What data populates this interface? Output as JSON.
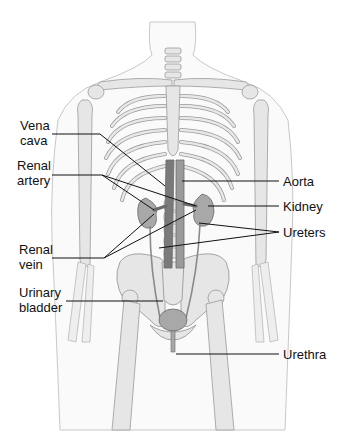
{
  "diagram": {
    "labels_left": [
      {
        "id": "vena-cava",
        "text": "Vena\ncava"
      },
      {
        "id": "renal-artery",
        "text": "Renal\nartery"
      },
      {
        "id": "renal-vein",
        "text": "Renal\nvein"
      },
      {
        "id": "urinary-bladder",
        "text": "Urinary\nbladder"
      }
    ],
    "labels_right": [
      {
        "id": "aorta",
        "text": "Aorta"
      },
      {
        "id": "kidney",
        "text": "Kidney"
      },
      {
        "id": "ureters",
        "text": "Ureters"
      },
      {
        "id": "urethra",
        "text": "Urethra"
      }
    ],
    "colors": {
      "bone": "#e6e6e6",
      "bone_stroke": "#9a9a9a",
      "skin_stroke": "#c8c8c8",
      "vessel": "#7a7a7a",
      "organ": "#a8a8a8",
      "leader": "#111111"
    }
  }
}
